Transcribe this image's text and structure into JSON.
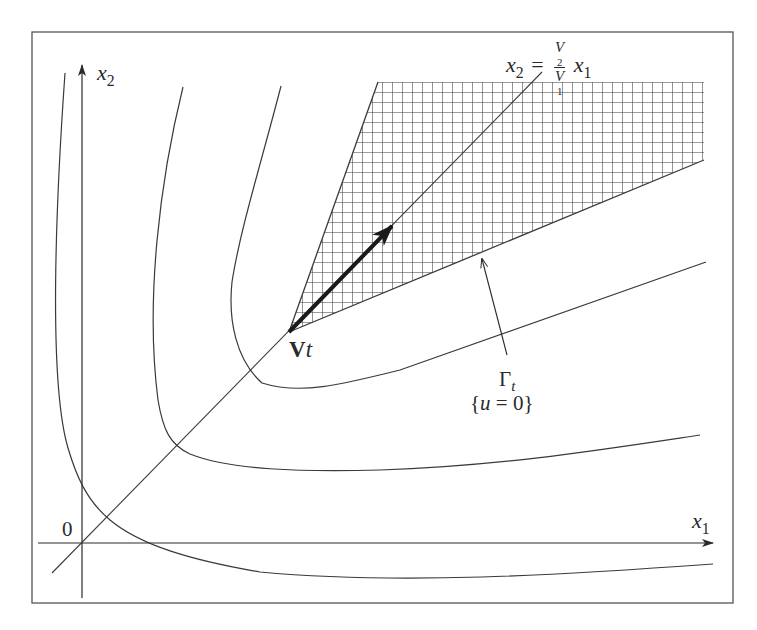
{
  "figure": {
    "frame": {
      "x": 32,
      "y": 32,
      "width": 701,
      "height": 571
    },
    "colors": {
      "stroke": "#3a3a3a",
      "hatch": "#3a3a3a",
      "background": "#ffffff",
      "arrow": "#1a1a1a"
    },
    "labels": {
      "x1_axis": {
        "var": "x",
        "sub": "1"
      },
      "x2_axis": {
        "var": "x",
        "sub": "2"
      },
      "origin": "0",
      "line_eq": {
        "lhs_var": "x",
        "lhs_sub": "2",
        "equals": "=",
        "num_var": "V",
        "num_sub": "2",
        "den_var": "V",
        "den_sub": "1",
        "rhs_var": "x",
        "rhs_sub": "1"
      },
      "vertex": {
        "bold": "V",
        "italic": "t"
      },
      "gamma": {
        "symbol": "Γ",
        "sub": "t"
      },
      "set": "{u = 0}"
    },
    "elements": {
      "axes": {
        "origin": [
          82,
          543
        ],
        "x_end": [
          713,
          543
        ],
        "y_end": [
          82,
          65
        ],
        "x_start": 38,
        "y_start": 598
      },
      "diagonal_line": {
        "from": [
          52,
          573
        ],
        "to": [
          542,
          72
        ]
      },
      "hatched_region": {
        "vertex": [
          289,
          332
        ],
        "top_left": [
          378,
          82
        ],
        "top_right": [
          704,
          82
        ],
        "bottom_right": [
          704,
          160
        ],
        "grid_spacing": 10
      },
      "velocity_arrow": {
        "from": [
          289,
          332
        ],
        "to": [
          392,
          226
        ]
      },
      "gamma_pointer": {
        "from": [
          507,
          355
        ],
        "to": [
          482,
          258
        ]
      },
      "level_curves": [
        "M65,73 C56,200 48,380 68,448 C76,475 86,500 110,520 C140,545 190,560 260,572 C400,585 560,575 713,564",
        "M183,87 C160,180 145,300 158,400 C163,430 170,445 190,454 C230,470 300,472 380,470 C500,466 600,450 700,435",
        "M281,86 C262,160 240,230 232,282 C228,320 236,360 262,383 C300,395 340,385 400,370 C500,335 600,300 706,262"
      ]
    }
  }
}
